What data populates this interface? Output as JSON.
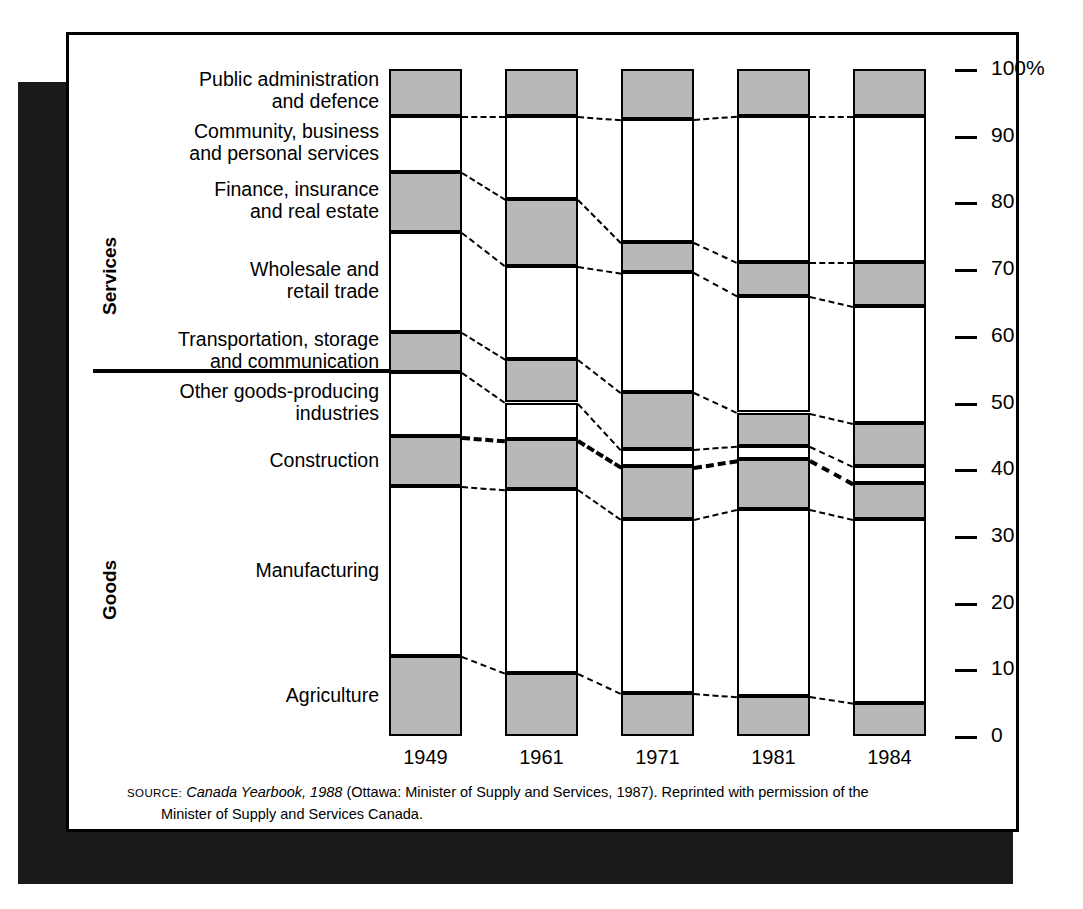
{
  "chart_data": {
    "type": "bar",
    "title": "",
    "subtitle": "",
    "xlabel": "",
    "ylabel": "",
    "ylim": [
      0,
      100
    ],
    "grid": false,
    "legend_position": "left-labels",
    "stacked": true,
    "unit": "percent",
    "categories": [
      "1949",
      "1961",
      "1971",
      "1981",
      "1984"
    ],
    "tick_labels": [
      "100%",
      "90",
      "80",
      "70",
      "60",
      "50",
      "40",
      "30",
      "20",
      "10",
      "0"
    ],
    "tick_values": [
      100,
      90,
      80,
      70,
      60,
      50,
      40,
      30,
      20,
      10,
      0
    ],
    "group_labels": [
      "Services",
      "Goods"
    ],
    "group_divider_value": 55,
    "series": [
      {
        "name": "Public administration and defence",
        "fill": "gray",
        "values": [
          7.0,
          7.0,
          7.5,
          7.0,
          7.0
        ]
      },
      {
        "name": "Community, business and personal services",
        "fill": "white",
        "values": [
          8.5,
          12.5,
          18.5,
          22.0,
          22.0
        ]
      },
      {
        "name": "Finance, insurance and real estate",
        "fill": "gray",
        "values": [
          9.0,
          10.0,
          4.5,
          5.0,
          6.5
        ]
      },
      {
        "name": "Wholesale and retail trade",
        "fill": "white",
        "values": [
          15.0,
          14.0,
          18.0,
          17.5,
          17.5
        ]
      },
      {
        "name": "Transportation, storage and communication",
        "fill": "gray",
        "values": [
          6.0,
          6.5,
          8.5,
          5.0,
          6.5
        ]
      },
      {
        "name": "Other goods-producing industries",
        "fill": "white",
        "values": [
          9.5,
          5.5,
          2.5,
          2.0,
          2.5
        ]
      },
      {
        "name": "Construction",
        "fill": "gray",
        "values": [
          7.5,
          7.5,
          8.0,
          7.5,
          5.5
        ]
      },
      {
        "name": "Manufacturing",
        "fill": "white",
        "values": [
          25.5,
          27.5,
          26.0,
          28.0,
          27.5
        ]
      },
      {
        "name": "Agriculture",
        "fill": "gray",
        "values": [
          12.0,
          9.5,
          6.5,
          6.0,
          5.0
        ]
      }
    ]
  },
  "axis": {
    "ticks": [
      {
        "label": "100%",
        "value": 100
      },
      {
        "label": "90",
        "value": 90
      },
      {
        "label": "80",
        "value": 80
      },
      {
        "label": "70",
        "value": 70
      },
      {
        "label": "60",
        "value": 60
      },
      {
        "label": "50",
        "value": 50
      },
      {
        "label": "40",
        "value": 40
      },
      {
        "label": "30",
        "value": 30
      },
      {
        "label": "20",
        "value": 20
      },
      {
        "label": "10",
        "value": 10
      },
      {
        "label": "0",
        "value": 0
      }
    ]
  },
  "groups": {
    "services": "Services",
    "goods": "Goods"
  },
  "category_labels": [
    {
      "line1": "Public administration",
      "line2": "and defence"
    },
    {
      "line1": "Community, business",
      "line2": "and personal services"
    },
    {
      "line1": "Finance, insurance",
      "line2": "and real estate"
    },
    {
      "line1": "Wholesale and",
      "line2": "retail trade"
    },
    {
      "line1": "Transportation, storage",
      "line2": "and communication"
    },
    {
      "line1": "Other goods-producing",
      "line2": "industries"
    },
    {
      "line1": "Construction",
      "line2": ""
    },
    {
      "line1": "Manufacturing",
      "line2": ""
    },
    {
      "line1": "Agriculture",
      "line2": ""
    }
  ],
  "years": [
    "1949",
    "1961",
    "1971",
    "1981",
    "1984"
  ],
  "source": {
    "lead": "SOURCE:",
    "italic": "Canada Yearbook, 1988",
    "rest": " (Ottawa: Minister of Supply and Services, 1987). Reprinted with permission of the",
    "line2": "Minister of Supply and Services Canada."
  },
  "colors": {
    "gray_fill": "#b8b8b8",
    "white_fill": "#ffffff",
    "stroke": "#000000",
    "shadow": "#1a1a1a"
  }
}
